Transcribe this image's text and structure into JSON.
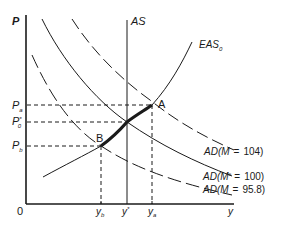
{
  "diagram": {
    "type": "economics-ad-as",
    "axes": {
      "y_label": "P",
      "x_label": "y",
      "origin_label": "0"
    },
    "price_levels": {
      "pa": {
        "main": "P",
        "sub": "a"
      },
      "pstar": {
        "main": "P",
        "sup": "*",
        "sub": "0"
      },
      "pb": {
        "main": "P",
        "sub": "b"
      }
    },
    "output_levels": {
      "yb": {
        "main": "y",
        "sub": "b"
      },
      "ystar": {
        "main": "y",
        "sup": "*"
      },
      "ya": {
        "main": "y",
        "sub": "a"
      }
    },
    "curves": {
      "as": "AS",
      "eas": {
        "main": "EAS",
        "sub": "0"
      },
      "ad_high": {
        "prefix": "AD(M",
        "eq": "=",
        "value": "104)"
      },
      "ad_mid": {
        "prefix": "AD(M",
        "sup": "e",
        "eq": "=",
        "value": "100)"
      },
      "ad_low": {
        "prefix": "AD(M",
        "eq": "=",
        "value": "95.8)"
      }
    },
    "points": {
      "a": "A",
      "b": "B"
    },
    "colors": {
      "ink": "#1a1a1a",
      "background": "#ffffff"
    }
  }
}
